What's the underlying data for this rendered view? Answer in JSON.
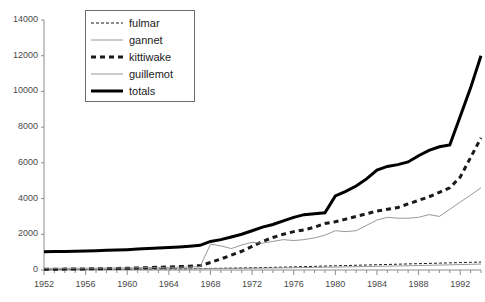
{
  "chart_data": {
    "type": "line",
    "title": "",
    "xlabel": "",
    "ylabel": "",
    "xlim": [
      1952,
      1994
    ],
    "ylim": [
      0,
      14000
    ],
    "grid": false,
    "legend_position": "top-left",
    "x_tick_labels": [
      "1952",
      "1956",
      "1960",
      "1964",
      "1968",
      "1972",
      "1976",
      "1980",
      "1984",
      "1988",
      "1992"
    ],
    "x_tick_values": [
      1952,
      1956,
      1960,
      1964,
      1968,
      1972,
      1976,
      1980,
      1984,
      1988,
      1992
    ],
    "y_tick_labels": [
      "0",
      "2000",
      "4000",
      "6000",
      "8000",
      "10000",
      "12000",
      "14000"
    ],
    "y_tick_values": [
      0,
      2000,
      4000,
      6000,
      8000,
      10000,
      12000,
      14000
    ],
    "x": [
      1952,
      1953,
      1954,
      1955,
      1956,
      1957,
      1958,
      1959,
      1960,
      1961,
      1962,
      1963,
      1964,
      1965,
      1966,
      1967,
      1968,
      1969,
      1970,
      1971,
      1972,
      1973,
      1974,
      1975,
      1976,
      1977,
      1978,
      1979,
      1980,
      1981,
      1982,
      1983,
      1984,
      1985,
      1986,
      1987,
      1988,
      1989,
      1990,
      1991,
      1992,
      1993,
      1994
    ],
    "series": [
      {
        "name": "fulmar",
        "style": "fine-dashed",
        "color": "#1a1a1a",
        "values": [
          20,
          22,
          25,
          28,
          30,
          33,
          36,
          40,
          44,
          48,
          52,
          57,
          62,
          68,
          74,
          80,
          88,
          95,
          105,
          115,
          125,
          135,
          148,
          160,
          175,
          190,
          205,
          220,
          235,
          250,
          265,
          280,
          295,
          310,
          325,
          340,
          355,
          370,
          385,
          400,
          415,
          430,
          445
        ]
      },
      {
        "name": "gannet",
        "style": "thin-solid",
        "color": "#8c8c8c",
        "values": [
          30,
          32,
          34,
          36,
          38,
          40,
          42,
          45,
          48,
          51,
          54,
          58,
          62,
          66,
          70,
          75,
          80,
          85,
          90,
          96,
          102,
          108,
          115,
          122,
          130,
          138,
          146,
          155,
          164,
          173,
          183,
          193,
          204,
          215,
          226,
          238,
          250,
          263,
          276,
          290,
          304,
          318,
          333
        ]
      },
      {
        "name": "kittiwake",
        "style": "bold-dashed",
        "color": "#1a1a1a",
        "values": [
          40,
          45,
          50,
          55,
          60,
          70,
          80,
          90,
          100,
          115,
          130,
          150,
          170,
          190,
          215,
          245,
          420,
          620,
          830,
          1050,
          1320,
          1600,
          1820,
          2000,
          2150,
          2250,
          2400,
          2600,
          2700,
          2850,
          3000,
          3150,
          3300,
          3400,
          3500,
          3700,
          3900,
          4100,
          4350,
          4600,
          5200,
          6300,
          7400
        ]
      },
      {
        "name": "guillemot",
        "style": "thin-solid",
        "color": "#8c8c8c",
        "values": [
          90,
          92,
          95,
          98,
          100,
          105,
          110,
          115,
          120,
          126,
          132,
          140,
          148,
          158,
          170,
          185,
          1450,
          1350,
          1200,
          1400,
          1550,
          1500,
          1600,
          1700,
          1650,
          1700,
          1800,
          1950,
          2200,
          2150,
          2200,
          2500,
          2800,
          2950,
          2900,
          2900,
          2950,
          3100,
          3000,
          3400,
          3800,
          4200,
          4600
        ]
      },
      {
        "name": "totals",
        "style": "bold-solid",
        "color": "#000000",
        "values": [
          1020,
          1030,
          1040,
          1050,
          1060,
          1080,
          1100,
          1120,
          1140,
          1170,
          1200,
          1230,
          1260,
          1290,
          1330,
          1380,
          1600,
          1700,
          1850,
          2000,
          2200,
          2400,
          2550,
          2750,
          2950,
          3100,
          3150,
          3200,
          4150,
          4400,
          4700,
          5100,
          5600,
          5800,
          5900,
          6050,
          6400,
          6700,
          6900,
          7000,
          8600,
          10200,
          12000
        ]
      }
    ],
    "legend": [
      {
        "label": "fulmar",
        "style": "fine-dashed"
      },
      {
        "label": "gannet",
        "style": "thin-solid"
      },
      {
        "label": "kittiwake",
        "style": "bold-dashed"
      },
      {
        "label": "guillemot",
        "style": "thin-solid"
      },
      {
        "label": "totals",
        "style": "bold-solid"
      }
    ],
    "axis_color": "#8c8c8c",
    "tick_label_color": "#4a4a4a"
  }
}
